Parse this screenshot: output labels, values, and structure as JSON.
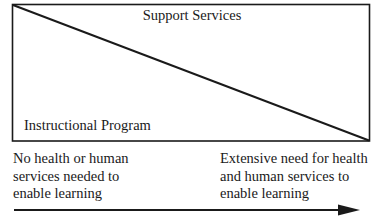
{
  "diagram": {
    "upper_region_label": "Support Services",
    "lower_region_label": "Instructional Program",
    "axis": {
      "left_end_lines": [
        "No health or human",
        "services needed to",
        "enable learning"
      ],
      "right_end_lines": [
        "Extensive need for health",
        "and human services to",
        "enable learning"
      ],
      "direction": "left-to-right"
    },
    "colors": {
      "stroke": "#1a1a1a",
      "background": "#ffffff"
    }
  }
}
